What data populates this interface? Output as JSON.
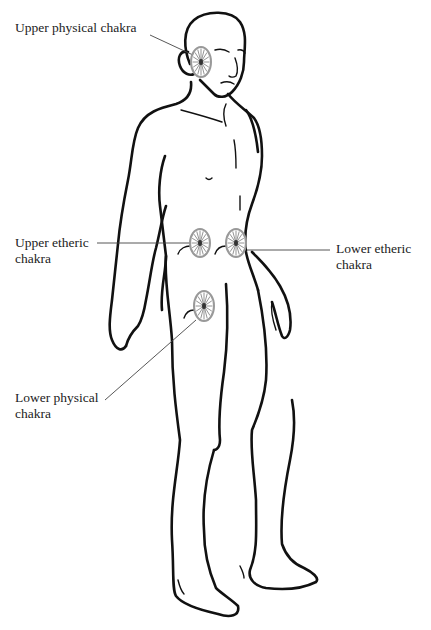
{
  "figure": {
    "chakras": [
      {
        "id": "upper-physical",
        "label_lines": [
          "Upper physical chakra"
        ],
        "cx": 201,
        "cy": 62,
        "rx": 10,
        "ry": 15,
        "label_x": 15,
        "label_y": 20,
        "leader": [
          150,
          35,
          193,
          55
        ]
      },
      {
        "id": "upper-etheric",
        "label_lines": [
          "Upper etheric",
          "chakra"
        ],
        "cx": 200,
        "cy": 243,
        "rx": 10,
        "ry": 14,
        "label_x": 15,
        "label_y": 235,
        "leader": [
          97,
          243,
          190,
          243
        ]
      },
      {
        "id": "lower-etheric",
        "label_lines": [
          "Lower etheric",
          "chakra"
        ],
        "cx": 236,
        "cy": 243,
        "rx": 10,
        "ry": 14,
        "label_x": 336,
        "label_y": 241,
        "leader": [
          247,
          250,
          330,
          250
        ]
      },
      {
        "id": "lower-physical",
        "label_lines": [
          "Lower physical",
          "chakra"
        ],
        "cx": 204,
        "cy": 306,
        "rx": 10,
        "ry": 15,
        "label_x": 15,
        "label_y": 390,
        "leader": [
          105,
          400,
          196,
          320
        ]
      }
    ],
    "colors": {
      "outline": "#111111",
      "wheel": "#999999",
      "text": "#222222",
      "background": "#ffffff"
    }
  }
}
